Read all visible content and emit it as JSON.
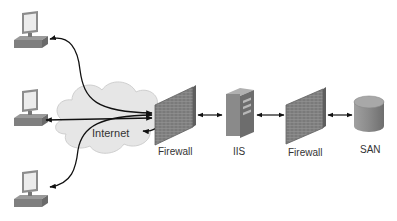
{
  "diagram": {
    "type": "network-topology",
    "nodes": {
      "client_top": {
        "label": "",
        "icon": "desktop-computer-icon"
      },
      "client_middle": {
        "label": "",
        "icon": "desktop-computer-icon"
      },
      "client_bottom": {
        "label": "",
        "icon": "desktop-computer-icon"
      },
      "internet": {
        "label": "Internet",
        "icon": "cloud-icon"
      },
      "firewall_outer": {
        "label": "Firewall",
        "icon": "brick-wall-icon"
      },
      "iis": {
        "label": "IIS",
        "icon": "server-tower-icon"
      },
      "firewall_inner": {
        "label": "Firewall",
        "icon": "brick-wall-icon"
      },
      "san": {
        "label": "SAN",
        "icon": "storage-cylinder-icon"
      }
    },
    "edges": [
      {
        "from": "client_top",
        "to": "firewall_outer",
        "via": "internet",
        "direction": "bidirectional"
      },
      {
        "from": "client_middle",
        "to": "firewall_outer",
        "via": "internet",
        "direction": "bidirectional"
      },
      {
        "from": "client_bottom",
        "to": "firewall_outer",
        "via": "internet",
        "direction": "bidirectional"
      },
      {
        "from": "firewall_outer",
        "to": "iis",
        "direction": "bidirectional"
      },
      {
        "from": "iis",
        "to": "firewall_inner",
        "direction": "bidirectional"
      },
      {
        "from": "firewall_inner",
        "to": "san",
        "direction": "bidirectional"
      }
    ],
    "colors": {
      "background": "#ffffff",
      "line": "#111111",
      "cloud_fill": "#e6e6e6",
      "device_gray": "#8a8a8a",
      "label_text": "#333333"
    }
  }
}
